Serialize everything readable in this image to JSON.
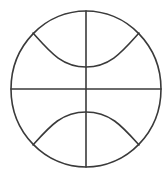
{
  "icon": {
    "name": "basketball-icon",
    "stroke_color": "#3a3a3a",
    "background_color": "#ffffff"
  }
}
